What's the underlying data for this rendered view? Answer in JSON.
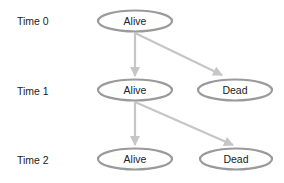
{
  "diagram": {
    "rows": [
      {
        "label": "Time 0",
        "y": 21
      },
      {
        "label": "Time 1",
        "y": 90
      },
      {
        "label": "Time 2",
        "y": 159
      }
    ],
    "nodes": [
      {
        "id": "t0-alive",
        "label": "Alive",
        "cx": 135,
        "cy": 21
      },
      {
        "id": "t1-alive",
        "label": "Alive",
        "cx": 135,
        "cy": 90
      },
      {
        "id": "t1-dead",
        "label": "Dead",
        "cx": 235,
        "cy": 90
      },
      {
        "id": "t2-alive",
        "label": "Alive",
        "cx": 135,
        "cy": 159
      },
      {
        "id": "t2-dead",
        "label": "Dead",
        "cx": 236,
        "cy": 159
      }
    ],
    "edges": [
      {
        "from": "t0-alive",
        "to": "t1-alive"
      },
      {
        "from": "t0-alive",
        "to": "t1-dead"
      },
      {
        "from": "t1-alive",
        "to": "t2-alive"
      },
      {
        "from": "t1-alive",
        "to": "t2-dead"
      }
    ],
    "colors": {
      "node_stroke": "#9a9a9a",
      "edge": "#c6c6c6",
      "text": "#222222",
      "background": "#ffffff"
    }
  }
}
